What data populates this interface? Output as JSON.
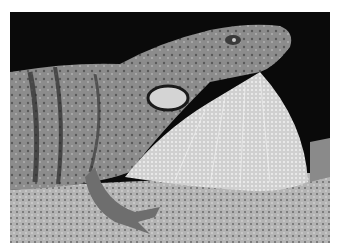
{
  "image": {
    "subject": "anole lizard with extended dewlap",
    "alt": "Grayscale photograph of an anole lizard perched on a branch, displaying its extended dewlap against a black background",
    "colors": {
      "background": "#0a0a0a",
      "border": "#ffffff",
      "branch": "#b8b8b8",
      "body": "#8a8a8a",
      "dewlap": "#d6d6d6",
      "dark_markings": "#2a2a2a"
    }
  }
}
